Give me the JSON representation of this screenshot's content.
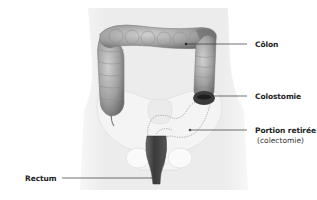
{
  "diagram": {
    "labels": [
      {
        "id": "colon",
        "text": "Côlon"
      },
      {
        "id": "colostomie",
        "text": "Colostomie"
      },
      {
        "id": "portion",
        "text": "Portion retirée",
        "subtext": "(colectomie)"
      },
      {
        "id": "rectum",
        "text": "Rectum"
      }
    ],
    "colors": {
      "background": "#ffffff",
      "body_silhouette": "#eeeeee",
      "colon": "#9a9a9a",
      "colon_dark": "#555555",
      "stoma": "#3a3a3a",
      "rectum": "#4a4a4a",
      "leader_line": "#333333",
      "removed_outline": "#777777"
    }
  }
}
